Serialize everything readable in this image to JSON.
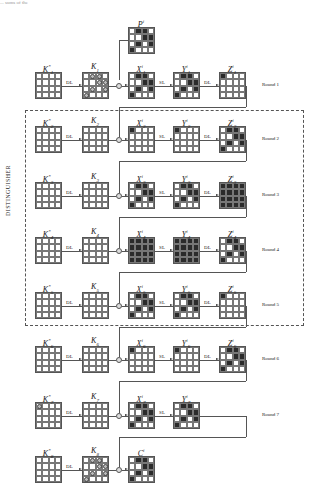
{
  "top_fragment": "... sums of the",
  "distinguisher_label": "DISTINGUISHER",
  "operations": {
    "dl": "DL",
    "sl": "SL",
    "xor": "⊕"
  },
  "colors": {
    "filled": "#2b2b2b",
    "line": "#555555",
    "dash": "#555555"
  },
  "plaintext": {
    "label": "P",
    "sup": "i",
    "cells": [
      [
        0,
        1,
        1,
        0
      ],
      [
        0,
        0,
        1,
        1
      ],
      [
        0,
        1,
        0,
        1
      ],
      [
        1,
        0,
        0,
        0
      ]
    ]
  },
  "ciphertext": {
    "label": "C",
    "sup": "i",
    "cells": [
      [
        0,
        1,
        1,
        0
      ],
      [
        0,
        0,
        1,
        1
      ],
      [
        0,
        1,
        0,
        1
      ],
      [
        1,
        0,
        0,
        0
      ]
    ]
  },
  "rounds": [
    {
      "label": "Round 1",
      "kstar": "K",
      "kstar_sub": "1",
      "k": "K",
      "k_sub": "1",
      "kstar_marks": [
        [
          0,
          0,
          0,
          0
        ],
        [
          0,
          0,
          0,
          0
        ],
        [
          0,
          0,
          0,
          0
        ],
        [
          0,
          0,
          0,
          0
        ]
      ],
      "k_marks": [
        [
          0,
          1,
          1,
          0
        ],
        [
          0,
          0,
          1,
          1
        ],
        [
          0,
          1,
          0,
          1
        ],
        [
          1,
          0,
          0,
          0
        ]
      ],
      "x": [
        [
          0,
          1,
          1,
          0
        ],
        [
          0,
          0,
          1,
          1
        ],
        [
          0,
          1,
          0,
          1
        ],
        [
          1,
          0,
          0,
          0
        ]
      ],
      "y": [
        [
          0,
          1,
          1,
          0
        ],
        [
          0,
          0,
          1,
          1
        ],
        [
          0,
          1,
          0,
          1
        ],
        [
          1,
          0,
          0,
          0
        ]
      ],
      "z": [
        [
          1,
          0,
          0,
          0
        ],
        [
          0,
          0,
          0,
          0
        ],
        [
          0,
          0,
          0,
          0
        ],
        [
          0,
          0,
          0,
          0
        ]
      ]
    },
    {
      "label": "Round 2",
      "kstar": "K",
      "kstar_sub": "2",
      "k": "K",
      "k_sub": "2",
      "kstar_marks": [
        [
          0,
          0,
          0,
          0
        ],
        [
          0,
          0,
          0,
          0
        ],
        [
          0,
          0,
          0,
          0
        ],
        [
          0,
          0,
          0,
          0
        ]
      ],
      "k_marks": [
        [
          0,
          0,
          0,
          0
        ],
        [
          0,
          0,
          0,
          0
        ],
        [
          0,
          0,
          0,
          0
        ],
        [
          0,
          0,
          0,
          0
        ]
      ],
      "x": [
        [
          1,
          0,
          0,
          0
        ],
        [
          0,
          0,
          0,
          0
        ],
        [
          0,
          0,
          0,
          0
        ],
        [
          0,
          0,
          0,
          0
        ]
      ],
      "y": [
        [
          1,
          0,
          0,
          0
        ],
        [
          0,
          0,
          0,
          0
        ],
        [
          0,
          0,
          0,
          0
        ],
        [
          0,
          0,
          0,
          0
        ]
      ],
      "z": [
        [
          0,
          1,
          1,
          0
        ],
        [
          0,
          0,
          1,
          1
        ],
        [
          0,
          1,
          0,
          1
        ],
        [
          1,
          0,
          0,
          0
        ]
      ]
    },
    {
      "label": "Round 3",
      "kstar": "K",
      "kstar_sub": "3",
      "k": "K",
      "k_sub": "3",
      "kstar_marks": [
        [
          0,
          0,
          0,
          0
        ],
        [
          0,
          0,
          0,
          0
        ],
        [
          0,
          0,
          0,
          0
        ],
        [
          0,
          0,
          0,
          0
        ]
      ],
      "k_marks": [
        [
          0,
          0,
          0,
          0
        ],
        [
          0,
          0,
          0,
          0
        ],
        [
          0,
          0,
          0,
          0
        ],
        [
          0,
          0,
          0,
          0
        ]
      ],
      "x": [
        [
          0,
          1,
          1,
          0
        ],
        [
          0,
          0,
          1,
          1
        ],
        [
          0,
          1,
          0,
          1
        ],
        [
          1,
          0,
          0,
          0
        ]
      ],
      "y": [
        [
          0,
          1,
          1,
          0
        ],
        [
          0,
          0,
          1,
          1
        ],
        [
          0,
          1,
          0,
          1
        ],
        [
          1,
          0,
          0,
          0
        ]
      ],
      "z": [
        [
          1,
          1,
          1,
          1
        ],
        [
          1,
          1,
          1,
          1
        ],
        [
          1,
          1,
          1,
          1
        ],
        [
          1,
          1,
          1,
          1
        ]
      ]
    },
    {
      "label": "Round 4",
      "kstar": "K",
      "kstar_sub": "4",
      "k": "K",
      "k_sub": "4",
      "kstar_marks": [
        [
          0,
          0,
          0,
          0
        ],
        [
          0,
          0,
          0,
          0
        ],
        [
          0,
          0,
          0,
          0
        ],
        [
          0,
          0,
          0,
          0
        ]
      ],
      "k_marks": [
        [
          0,
          0,
          0,
          0
        ],
        [
          0,
          0,
          0,
          0
        ],
        [
          0,
          0,
          0,
          0
        ],
        [
          0,
          0,
          0,
          0
        ]
      ],
      "x": [
        [
          1,
          1,
          1,
          1
        ],
        [
          1,
          1,
          1,
          1
        ],
        [
          1,
          1,
          1,
          1
        ],
        [
          1,
          1,
          1,
          1
        ]
      ],
      "y": [
        [
          1,
          1,
          1,
          1
        ],
        [
          1,
          1,
          1,
          1
        ],
        [
          1,
          1,
          1,
          1
        ],
        [
          1,
          1,
          1,
          1
        ]
      ],
      "z": [
        [
          0,
          1,
          1,
          0
        ],
        [
          0,
          0,
          1,
          1
        ],
        [
          0,
          1,
          0,
          1
        ],
        [
          1,
          0,
          0,
          0
        ]
      ]
    },
    {
      "label": "Round 5",
      "kstar": "K",
      "kstar_sub": "5",
      "k": "K",
      "k_sub": "5",
      "kstar_marks": [
        [
          0,
          0,
          0,
          0
        ],
        [
          0,
          0,
          0,
          0
        ],
        [
          0,
          0,
          0,
          0
        ],
        [
          0,
          0,
          0,
          0
        ]
      ],
      "k_marks": [
        [
          0,
          0,
          0,
          0
        ],
        [
          0,
          0,
          0,
          0
        ],
        [
          0,
          0,
          0,
          0
        ],
        [
          0,
          0,
          0,
          0
        ]
      ],
      "x": [
        [
          0,
          1,
          1,
          0
        ],
        [
          0,
          0,
          1,
          1
        ],
        [
          0,
          1,
          0,
          1
        ],
        [
          1,
          0,
          0,
          0
        ]
      ],
      "y": [
        [
          0,
          1,
          1,
          0
        ],
        [
          0,
          0,
          1,
          1
        ],
        [
          0,
          1,
          0,
          1
        ],
        [
          1,
          0,
          0,
          0
        ]
      ],
      "z": [
        [
          1,
          0,
          0,
          0
        ],
        [
          0,
          0,
          0,
          0
        ],
        [
          0,
          0,
          0,
          0
        ],
        [
          0,
          0,
          0,
          0
        ]
      ]
    },
    {
      "label": "Round 6",
      "kstar": "K",
      "kstar_sub": "6",
      "k": "K",
      "k_sub": "6",
      "kstar_marks": [
        [
          0,
          0,
          0,
          0
        ],
        [
          0,
          0,
          0,
          0
        ],
        [
          0,
          0,
          0,
          0
        ],
        [
          0,
          0,
          0,
          0
        ]
      ],
      "k_marks": [
        [
          0,
          0,
          0,
          0
        ],
        [
          0,
          0,
          0,
          0
        ],
        [
          0,
          0,
          0,
          0
        ],
        [
          0,
          0,
          0,
          0
        ]
      ],
      "x": [
        [
          1,
          0,
          0,
          0
        ],
        [
          0,
          0,
          0,
          0
        ],
        [
          0,
          0,
          0,
          0
        ],
        [
          0,
          0,
          0,
          0
        ]
      ],
      "y": [
        [
          1,
          0,
          0,
          0
        ],
        [
          0,
          0,
          0,
          0
        ],
        [
          0,
          0,
          0,
          0
        ],
        [
          0,
          0,
          0,
          0
        ]
      ],
      "z": [
        [
          0,
          1,
          1,
          0
        ],
        [
          0,
          0,
          1,
          1
        ],
        [
          0,
          1,
          0,
          1
        ],
        [
          1,
          0,
          0,
          0
        ]
      ]
    },
    {
      "label": "Round 7",
      "kstar": "K",
      "kstar_sub": "7",
      "k": "K",
      "k_sub": "7",
      "kstar_marks": [
        [
          1,
          0,
          0,
          0
        ],
        [
          0,
          0,
          0,
          0
        ],
        [
          0,
          0,
          0,
          0
        ],
        [
          0,
          0,
          0,
          0
        ]
      ],
      "k_marks": [
        [
          0,
          0,
          0,
          0
        ],
        [
          0,
          0,
          0,
          0
        ],
        [
          0,
          0,
          0,
          0
        ],
        [
          0,
          0,
          0,
          0
        ]
      ],
      "x": [
        [
          0,
          1,
          1,
          0
        ],
        [
          0,
          0,
          1,
          1
        ],
        [
          0,
          1,
          0,
          1
        ],
        [
          1,
          0,
          0,
          0
        ]
      ],
      "y": [
        [
          0,
          1,
          1,
          0
        ],
        [
          0,
          0,
          1,
          1
        ],
        [
          0,
          1,
          0,
          1
        ],
        [
          1,
          0,
          0,
          0
        ]
      ],
      "z": null
    },
    {
      "label": "",
      "kstar": "K",
      "kstar_sub": "8",
      "k": "K",
      "k_sub": "8",
      "kstar_marks": [
        [
          0,
          0,
          0,
          0
        ],
        [
          0,
          0,
          0,
          0
        ],
        [
          0,
          0,
          0,
          0
        ],
        [
          0,
          0,
          0,
          0
        ]
      ],
      "k_marks": [
        [
          0,
          1,
          1,
          0
        ],
        [
          0,
          0,
          1,
          1
        ],
        [
          0,
          1,
          0,
          1
        ],
        [
          1,
          0,
          0,
          0
        ]
      ],
      "x": null,
      "y": null,
      "z": null
    }
  ]
}
